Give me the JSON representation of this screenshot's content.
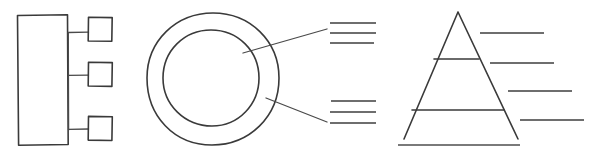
{
  "canvas": {
    "width": 591,
    "height": 157,
    "background": "#ffffff",
    "stroke_color": "#3a3a3a",
    "rule_color": "#6e6e6e",
    "title": "Sketch Diagram Set"
  },
  "diagrams": [
    {
      "id": "org-block-diagram",
      "name": "Block and branch diagram",
      "description": "Tall rectangle on the left linked by a vertical spine to three small squares on the right",
      "elements": {
        "main_block": {
          "label": "main-block",
          "x": 17,
          "y": 15,
          "width": 51,
          "height": 130
        },
        "spine": {
          "label": "vertical-spine",
          "x": 68,
          "y1": 34,
          "y2": 130
        },
        "branches": [
          {
            "label": "branch-node-1",
            "x": 88,
            "y": 17,
            "width": 24,
            "height": 24,
            "connector_y": 32
          },
          {
            "label": "branch-node-2",
            "x": 88,
            "y": 62,
            "width": 24,
            "height": 24,
            "connector_y": 75
          },
          {
            "label": "branch-node-3",
            "x": 88,
            "y": 116,
            "width": 24,
            "height": 24,
            "connector_y": 129
          }
        ]
      }
    },
    {
      "id": "donut-callout-diagram",
      "name": "Ring with callout labels",
      "description": "Hand drawn donut ring with two leader lines pointing to stacked label rules",
      "elements": {
        "outer_ring": {
          "label": "outer-ring",
          "cx": 213,
          "cy": 79,
          "rx": 66,
          "ry": 66
        },
        "inner_ring": {
          "label": "inner-ring",
          "cx": 211,
          "cy": 78,
          "rx": 48,
          "ry": 48
        },
        "callouts": [
          {
            "label": "callout-upper",
            "leader": {
              "x1": 243,
              "y1": 53,
              "x2": 327,
              "y2": 29
            },
            "rules": [
              {
                "x1": 330,
                "y1": 23,
                "x2": 376,
                "y2": 23
              },
              {
                "x1": 330,
                "y1": 33,
                "x2": 376,
                "y2": 33
              },
              {
                "x1": 330,
                "y1": 43,
                "x2": 374,
                "y2": 43
              }
            ]
          },
          {
            "label": "callout-lower",
            "leader": {
              "x1": 266,
              "y1": 98,
              "x2": 327,
              "y2": 122
            },
            "rules": [
              {
                "x1": 331,
                "y1": 101,
                "x2": 376,
                "y2": 101
              },
              {
                "x1": 330,
                "y1": 112,
                "x2": 376,
                "y2": 112
              },
              {
                "x1": 330,
                "y1": 123,
                "x2": 376,
                "y2": 123
              }
            ]
          }
        ]
      }
    },
    {
      "id": "pyramid-diagram",
      "name": "Three tier pyramid with labels",
      "description": "Triangle divided into three tiers with a baseline rule and four staggered label rules to the right",
      "elements": {
        "triangle": {
          "label": "pyramid-outline",
          "apex_x": 458,
          "apex_y": 12,
          "left_x": 404,
          "left_y": 139,
          "right_x": 518,
          "right_y": 139
        },
        "tier_dividers": [
          {
            "label": "tier-divider-1",
            "x1": 434,
            "y1": 59,
            "x2": 479,
            "y2": 59
          },
          {
            "label": "tier-divider-2",
            "x1": 412,
            "y1": 110,
            "x2": 504,
            "y2": 110
          }
        ],
        "baseline_rule": {
          "label": "pyramid-baseline",
          "x1": 398,
          "y1": 145,
          "x2": 520,
          "y2": 145
        },
        "label_rules": [
          {
            "label": "pyramid-label-1",
            "x1": 480,
            "y1": 33,
            "x2": 544,
            "y2": 33
          },
          {
            "label": "pyramid-label-2",
            "x1": 490,
            "y1": 63,
            "x2": 554,
            "y2": 63
          },
          {
            "label": "pyramid-label-3",
            "x1": 508,
            "y1": 91,
            "x2": 572,
            "y2": 91
          },
          {
            "label": "pyramid-label-4",
            "x1": 520,
            "y1": 120,
            "x2": 584,
            "y2": 120
          }
        ]
      }
    }
  ]
}
